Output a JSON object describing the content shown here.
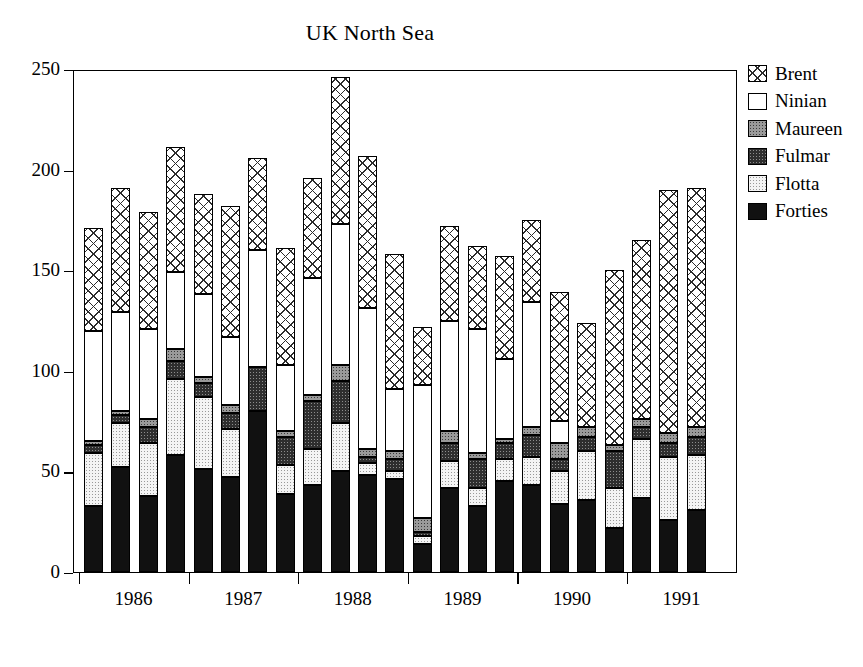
{
  "chart": {
    "title": "UK North Sea",
    "xlabel": "",
    "ylabel": ""
  },
  "legend": {
    "position": "right",
    "items": [
      {
        "label": "Brent",
        "key": "brent"
      },
      {
        "label": "Ninian",
        "key": "ninian"
      },
      {
        "label": "Maureen",
        "key": "maureen"
      },
      {
        "label": "Fulmar",
        "key": "fulmar"
      },
      {
        "label": "Flotta",
        "key": "flotta"
      },
      {
        "label": "Forties",
        "key": "forties"
      }
    ]
  },
  "axes": {
    "y_ticks": [
      "0",
      "50",
      "100",
      "150",
      "200",
      "250"
    ],
    "x_labels": [
      "1986",
      "1987",
      "1988",
      "1989",
      "1990",
      "1991"
    ]
  },
  "chart_data": {
    "type": "bar",
    "stacked": true,
    "title": "UK North Sea",
    "xlabel": "",
    "ylabel": "",
    "ylim": [
      0,
      250
    ],
    "yticks": [
      0,
      50,
      100,
      150,
      200,
      250
    ],
    "grid": false,
    "legend_position": "right",
    "group_labels": [
      "1986",
      "1987",
      "1988",
      "1989",
      "1990",
      "1991"
    ],
    "bars_per_group": 4,
    "categories": [
      "1986 Q1",
      "1986 Q2",
      "1986 Q3",
      "1986 Q4",
      "1987 Q1",
      "1987 Q2",
      "1987 Q3",
      "1987 Q4",
      "1988 Q1",
      "1988 Q2",
      "1988 Q3",
      "1988 Q4",
      "1989 Q1",
      "1989 Q2",
      "1989 Q3",
      "1989 Q4",
      "1990 Q1",
      "1990 Q2",
      "1990 Q3",
      "1990 Q4",
      "1991 Q1",
      "1991 Q2",
      "1991 Q3",
      "1991 Q4"
    ],
    "stack_order_bottom_to_top": [
      "Forties",
      "Flotta",
      "Fulmar",
      "Maureen",
      "Ninian",
      "Brent"
    ],
    "series": [
      {
        "name": "Forties",
        "key": "forties",
        "values": [
          33,
          52,
          38,
          58,
          51,
          47,
          80,
          39,
          43,
          50,
          48,
          46,
          14,
          42,
          33,
          45,
          43,
          34,
          36,
          22,
          37,
          26,
          31,
          0
        ]
      },
      {
        "name": "Flotta",
        "key": "flotta",
        "values": [
          26,
          22,
          25,
          38,
          36,
          31,
          0,
          28,
          18,
          24,
          6,
          0,
          10,
          13,
          9,
          19,
          21,
          17,
          24,
          20,
          29,
          31,
          26,
          0
        ]
      },
      {
        "name": "Fulmar",
        "key": "fulmar",
        "values": [
          4,
          4,
          11,
          9,
          7,
          0,
          22,
          0,
          24,
          21,
          0,
          8,
          0,
          14,
          14,
          0,
          6,
          12,
          7,
          18,
          0,
          7,
          9,
          0
        ]
      },
      {
        "name": "Maureen",
        "key": "maureen",
        "values": [
          2,
          2,
          0,
          6,
          3,
          4,
          0,
          3,
          3,
          8,
          0,
          2,
          3,
          5,
          2,
          2,
          2,
          8,
          0,
          3,
          0,
          4,
          5,
          0
        ]
      },
      {
        "name": "Ninian",
        "key": "ninian",
        "values": [
          55,
          49,
          46,
          38,
          41,
          35,
          58,
          33,
          58,
          70,
          77,
          35,
          66,
          55,
          63,
          40,
          62,
          74,
          12,
          0,
          0,
          0,
          0,
          0
        ]
      },
      {
        "name": "Brent",
        "key": "brent",
        "values": [
          51,
          62,
          59,
          62,
          50,
          65,
          46,
          58,
          50,
          73,
          76,
          67,
          29,
          43,
          41,
          51,
          41,
          44,
          60,
          61,
          84,
          97,
          120,
          191
        ]
      }
    ],
    "totals": [
      171,
      191,
      179,
      211,
      188,
      182,
      206,
      161,
      196,
      246,
      207,
      158,
      122,
      172,
      162,
      157,
      175,
      189,
      139,
      124,
      150,
      165,
      191,
      191
    ]
  },
  "bars": [
    {
      "total": 171,
      "stack": [
        {
          "key": "forties",
          "v": 33
        },
        {
          "key": "flotta",
          "v": 26
        },
        {
          "key": "fulmar",
          "v": 4
        },
        {
          "key": "maureen",
          "v": 2
        },
        {
          "key": "ninian",
          "v": 55
        },
        {
          "key": "brent",
          "v": 51
        }
      ]
    },
    {
      "total": 191,
      "stack": [
        {
          "key": "forties",
          "v": 52
        },
        {
          "key": "flotta",
          "v": 22
        },
        {
          "key": "fulmar",
          "v": 4
        },
        {
          "key": "maureen",
          "v": 2
        },
        {
          "key": "ninian",
          "v": 49
        },
        {
          "key": "brent",
          "v": 62
        }
      ]
    },
    {
      "total": 179,
      "stack": [
        {
          "key": "forties",
          "v": 38
        },
        {
          "key": "flotta",
          "v": 26
        },
        {
          "key": "fulmar",
          "v": 8
        },
        {
          "key": "maureen",
          "v": 4
        },
        {
          "key": "ninian",
          "v": 45
        },
        {
          "key": "brent",
          "v": 58
        }
      ]
    },
    {
      "total": 211,
      "stack": [
        {
          "key": "forties",
          "v": 58
        },
        {
          "key": "flotta",
          "v": 38
        },
        {
          "key": "fulmar",
          "v": 9
        },
        {
          "key": "maureen",
          "v": 6
        },
        {
          "key": "ninian",
          "v": 38
        },
        {
          "key": "brent",
          "v": 62
        }
      ]
    },
    {
      "total": 188,
      "stack": [
        {
          "key": "forties",
          "v": 51
        },
        {
          "key": "flotta",
          "v": 36
        },
        {
          "key": "fulmar",
          "v": 7
        },
        {
          "key": "maureen",
          "v": 3
        },
        {
          "key": "ninian",
          "v": 41
        },
        {
          "key": "brent",
          "v": 50
        }
      ]
    },
    {
      "total": 182,
      "stack": [
        {
          "key": "forties",
          "v": 47
        },
        {
          "key": "flotta",
          "v": 24
        },
        {
          "key": "fulmar",
          "v": 8
        },
        {
          "key": "maureen",
          "v": 4
        },
        {
          "key": "ninian",
          "v": 34
        },
        {
          "key": "brent",
          "v": 65
        }
      ]
    },
    {
      "total": 206,
      "stack": [
        {
          "key": "forties",
          "v": 80
        },
        {
          "key": "flotta",
          "v": 0
        },
        {
          "key": "fulmar",
          "v": 22
        },
        {
          "key": "maureen",
          "v": 0
        },
        {
          "key": "ninian",
          "v": 58
        },
        {
          "key": "brent",
          "v": 46
        }
      ]
    },
    {
      "total": 161,
      "stack": [
        {
          "key": "forties",
          "v": 39
        },
        {
          "key": "flotta",
          "v": 14
        },
        {
          "key": "fulmar",
          "v": 14
        },
        {
          "key": "maureen",
          "v": 3
        },
        {
          "key": "ninian",
          "v": 33
        },
        {
          "key": "brent",
          "v": 58
        }
      ]
    },
    {
      "total": 196,
      "stack": [
        {
          "key": "forties",
          "v": 43
        },
        {
          "key": "flotta",
          "v": 18
        },
        {
          "key": "fulmar",
          "v": 24
        },
        {
          "key": "maureen",
          "v": 3
        },
        {
          "key": "ninian",
          "v": 58
        },
        {
          "key": "brent",
          "v": 50
        }
      ]
    },
    {
      "total": 246,
      "stack": [
        {
          "key": "forties",
          "v": 50
        },
        {
          "key": "flotta",
          "v": 24
        },
        {
          "key": "fulmar",
          "v": 21
        },
        {
          "key": "maureen",
          "v": 8
        },
        {
          "key": "ninian",
          "v": 70
        },
        {
          "key": "brent",
          "v": 73
        }
      ]
    },
    {
      "total": 207,
      "stack": [
        {
          "key": "forties",
          "v": 48
        },
        {
          "key": "flotta",
          "v": 6
        },
        {
          "key": "fulmar",
          "v": 3
        },
        {
          "key": "maureen",
          "v": 4
        },
        {
          "key": "ninian",
          "v": 70
        },
        {
          "key": "brent",
          "v": 76
        }
      ]
    },
    {
      "total": 158,
      "stack": [
        {
          "key": "forties",
          "v": 46
        },
        {
          "key": "flotta",
          "v": 4
        },
        {
          "key": "fulmar",
          "v": 6
        },
        {
          "key": "maureen",
          "v": 4
        },
        {
          "key": "ninian",
          "v": 31
        },
        {
          "key": "brent",
          "v": 67
        }
      ]
    },
    {
      "total": 122,
      "stack": [
        {
          "key": "forties",
          "v": 14
        },
        {
          "key": "flotta",
          "v": 4
        },
        {
          "key": "fulmar",
          "v": 2
        },
        {
          "key": "maureen",
          "v": 7
        },
        {
          "key": "ninian",
          "v": 66
        },
        {
          "key": "brent",
          "v": 29
        }
      ]
    },
    {
      "total": 172,
      "stack": [
        {
          "key": "forties",
          "v": 42
        },
        {
          "key": "flotta",
          "v": 13
        },
        {
          "key": "fulmar",
          "v": 9
        },
        {
          "key": "maureen",
          "v": 6
        },
        {
          "key": "ninian",
          "v": 55
        },
        {
          "key": "brent",
          "v": 47
        }
      ]
    },
    {
      "total": 162,
      "stack": [
        {
          "key": "forties",
          "v": 33
        },
        {
          "key": "flotta",
          "v": 9
        },
        {
          "key": "fulmar",
          "v": 14
        },
        {
          "key": "maureen",
          "v": 3
        },
        {
          "key": "ninian",
          "v": 62
        },
        {
          "key": "brent",
          "v": 41
        }
      ]
    },
    {
      "total": 157,
      "stack": [
        {
          "key": "forties",
          "v": 45
        },
        {
          "key": "flotta",
          "v": 11
        },
        {
          "key": "fulmar",
          "v": 8
        },
        {
          "key": "maureen",
          "v": 2
        },
        {
          "key": "ninian",
          "v": 40
        },
        {
          "key": "brent",
          "v": 51
        }
      ]
    },
    {
      "total": 175,
      "stack": [
        {
          "key": "forties",
          "v": 43
        },
        {
          "key": "flotta",
          "v": 14
        },
        {
          "key": "fulmar",
          "v": 11
        },
        {
          "key": "maureen",
          "v": 4
        },
        {
          "key": "ninian",
          "v": 62
        },
        {
          "key": "brent",
          "v": 41
        }
      ]
    },
    {
      "total": 139,
      "stack": [
        {
          "key": "forties",
          "v": 34
        },
        {
          "key": "flotta",
          "v": 16
        },
        {
          "key": "fulmar",
          "v": 6
        },
        {
          "key": "maureen",
          "v": 8
        },
        {
          "key": "ninian",
          "v": 11
        },
        {
          "key": "brent",
          "v": 64
        }
      ]
    },
    {
      "total": 124,
      "stack": [
        {
          "key": "forties",
          "v": 36
        },
        {
          "key": "flotta",
          "v": 24
        },
        {
          "key": "fulmar",
          "v": 7
        },
        {
          "key": "maureen",
          "v": 5
        },
        {
          "key": "ninian",
          "v": 0
        },
        {
          "key": "brent",
          "v": 52
        }
      ]
    },
    {
      "total": 150,
      "stack": [
        {
          "key": "forties",
          "v": 22
        },
        {
          "key": "flotta",
          "v": 20
        },
        {
          "key": "fulmar",
          "v": 18
        },
        {
          "key": "maureen",
          "v": 3
        },
        {
          "key": "ninian",
          "v": 0
        },
        {
          "key": "brent",
          "v": 87
        }
      ]
    },
    {
      "total": 165,
      "stack": [
        {
          "key": "forties",
          "v": 37
        },
        {
          "key": "flotta",
          "v": 29
        },
        {
          "key": "fulmar",
          "v": 6
        },
        {
          "key": "maureen",
          "v": 4
        },
        {
          "key": "ninian",
          "v": 0
        },
        {
          "key": "brent",
          "v": 89
        }
      ]
    },
    {
      "total": 190,
      "stack": [
        {
          "key": "forties",
          "v": 26
        },
        {
          "key": "flotta",
          "v": 31
        },
        {
          "key": "fulmar",
          "v": 7
        },
        {
          "key": "maureen",
          "v": 5
        },
        {
          "key": "ninian",
          "v": 0
        },
        {
          "key": "brent",
          "v": 121
        }
      ]
    },
    {
      "total": 191,
      "stack": [
        {
          "key": "forties",
          "v": 31
        },
        {
          "key": "flotta",
          "v": 27
        },
        {
          "key": "fulmar",
          "v": 9
        },
        {
          "key": "maureen",
          "v": 5
        },
        {
          "key": "ninian",
          "v": 0
        },
        {
          "key": "brent",
          "v": 119
        }
      ]
    },
    {
      "total": 0,
      "stack": []
    }
  ],
  "geometry": {
    "plot_left": 73,
    "plot_top": 70,
    "plot_width": 664,
    "plot_height": 503,
    "y_max": 250,
    "bar_count": 24,
    "bar_width": 19,
    "bar_pitch": 27.4,
    "first_bar_left": 10
  }
}
